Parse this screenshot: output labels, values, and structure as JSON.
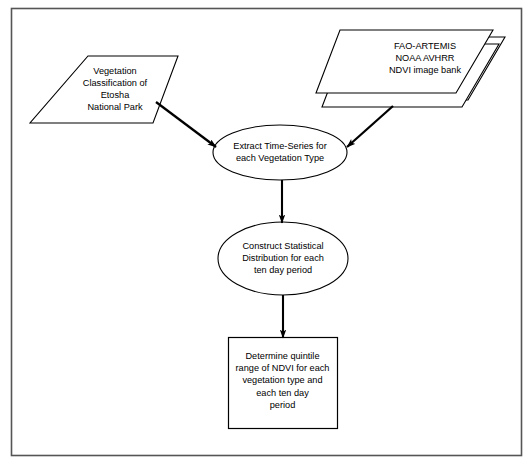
{
  "diagram": {
    "type": "flowchart",
    "frame": {
      "border_color": "#4d4d4d",
      "background": "#ffffff"
    },
    "stroke_color": "#000000",
    "nodes": [
      {
        "id": "vegetation-classification",
        "shape": "parallelogram",
        "role": "input-data",
        "text": "Vegetation\nClassification of\nEtosha\nNational Park"
      },
      {
        "id": "ndvi-image-bank",
        "shape": "stacked-parallelogram",
        "role": "input-data-store",
        "sheets": 3,
        "text": "FAO-ARTEMIS\nNOAA AVHRR\nNDVI image bank"
      },
      {
        "id": "extract-time-series",
        "shape": "ellipse",
        "role": "process",
        "text": "Extract Time-Series for\neach Vegetation Type"
      },
      {
        "id": "construct-distribution",
        "shape": "ellipse",
        "role": "process",
        "text": "Construct Statistical\nDistribution for each\nten day period"
      },
      {
        "id": "determine-quintile",
        "shape": "rectangle",
        "role": "output",
        "text": "Determine quintile\nrange of NDVI for each\nvegetation type and\neach ten day\nperiod"
      }
    ],
    "edges": [
      {
        "from": "vegetation-classification",
        "to": "extract-time-series",
        "style": "arrow-diagonal"
      },
      {
        "from": "ndvi-image-bank",
        "to": "extract-time-series",
        "style": "arrow-diagonal"
      },
      {
        "from": "extract-time-series",
        "to": "construct-distribution",
        "style": "arrow-vertical"
      },
      {
        "from": "construct-distribution",
        "to": "determine-quintile",
        "style": "arrow-vertical"
      }
    ]
  }
}
